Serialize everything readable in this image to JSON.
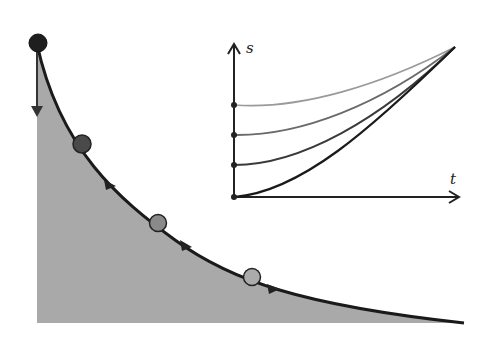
{
  "diagram": {
    "colors": {
      "fill": "#a9a9a9",
      "curve": "#1a1a1a",
      "ball_1": "#1e1e1e",
      "ball_2": "#4a4a4a",
      "ball_3": "#8a8a8a",
      "ball_4": "#a8a8a8",
      "inset_curves": [
        "#1a1a1a",
        "#3a3a3a",
        "#6a6a6a",
        "#9a9a9a"
      ]
    },
    "inset": {
      "x_label": "t",
      "y_label": "s",
      "start_points": 4
    }
  }
}
